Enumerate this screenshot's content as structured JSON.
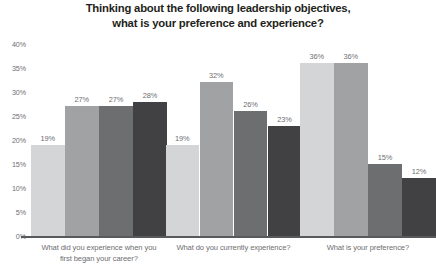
{
  "chart_data": {
    "type": "bar",
    "title": "Thinking about the following leadership objectives, what is your preference and experience?",
    "title_lines": [
      "Thinking about the following leadership objectives,",
      "what is your preference and experience?"
    ],
    "xlabel": "",
    "ylabel": "",
    "ylim": [
      0,
      40
    ],
    "grid": false,
    "legend": "none",
    "yticks": [
      "0%",
      "5%",
      "10%",
      "15%",
      "20%",
      "25%",
      "30%",
      "35%",
      "40%"
    ],
    "ytick_values": [
      0,
      5,
      10,
      15,
      20,
      25,
      30,
      35,
      40
    ],
    "categories": [
      "What did you experience when you first began your career?",
      "What do you currently experience?",
      "What is your preference?"
    ],
    "category_lines": [
      [
        "What did you experience when you",
        "first began your career?"
      ],
      [
        "What do you currently experience?"
      ],
      [
        "What is your preference?"
      ]
    ],
    "series": [
      {
        "name": "Series 1",
        "color": "#d4d5d6",
        "values": [
          19,
          19,
          36
        ],
        "labels": [
          "19%",
          "19%",
          "36%"
        ]
      },
      {
        "name": "Series 2",
        "color": "#a1a2a4",
        "values": [
          27,
          32,
          36
        ],
        "labels": [
          "27%",
          "32%",
          "36%"
        ]
      },
      {
        "name": "Series 3",
        "color": "#6d6e70",
        "values": [
          27,
          26,
          15
        ],
        "labels": [
          "27%",
          "26%",
          "15%"
        ]
      },
      {
        "name": "Series 4",
        "color": "#414042",
        "values": [
          28,
          23,
          12
        ],
        "labels": [
          "28%",
          "23%",
          "12%"
        ]
      }
    ],
    "axis_color": "#58595b",
    "label_color": "#6d6e71",
    "title_color": "#231f20",
    "background": "#ffffff"
  }
}
